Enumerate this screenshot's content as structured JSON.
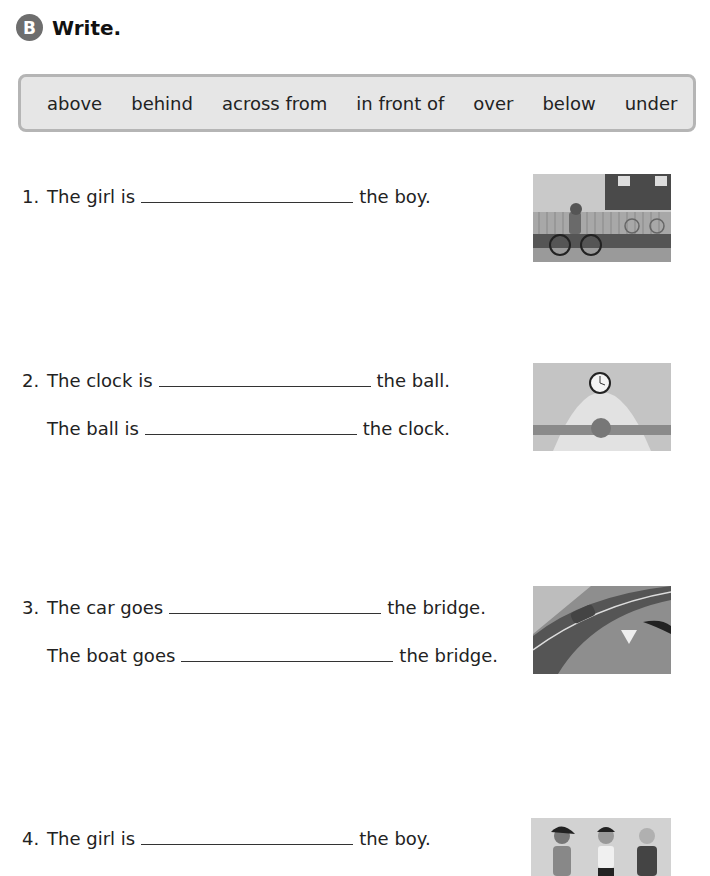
{
  "header": {
    "badge": "B",
    "title": "Write."
  },
  "word_bank": [
    "above",
    "behind",
    "across from",
    "in front of",
    "over",
    "below",
    "under"
  ],
  "questions": [
    {
      "number": "1.",
      "lines": [
        {
          "before": "The girl is",
          "after": "the boy."
        }
      ],
      "image": "girl-riding-bike-in-front-of-boy-with-bike"
    },
    {
      "number": "2.",
      "lines": [
        {
          "before": "The clock is",
          "after": "the ball."
        },
        {
          "before": "The ball is",
          "after": "the clock."
        }
      ],
      "image": "clock-above-ball-on-shelf"
    },
    {
      "number": "3.",
      "lines": [
        {
          "before": "The car goes",
          "after": "the bridge."
        },
        {
          "before": "The boat goes",
          "after": "the bridge."
        }
      ],
      "image": "car-on-bridge-boat-under-bridge"
    },
    {
      "number": "4.",
      "lines": [
        {
          "before": "The girl is",
          "after": "the boy."
        }
      ],
      "image": "three-children-standing"
    }
  ]
}
